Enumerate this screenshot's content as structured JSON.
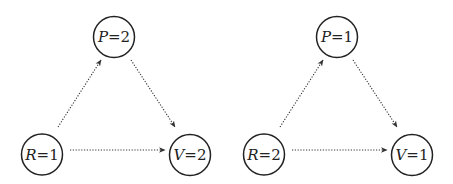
{
  "diagrams": [
    {
      "name": "left",
      "nodes": [
        {
          "id": "P",
          "variable": "P",
          "value": "2",
          "label": "P=2",
          "cx": 114,
          "cy": 37,
          "r": 20.5
        },
        {
          "id": "R",
          "variable": "R",
          "value": "1",
          "label": "R=1",
          "cx": 42,
          "cy": 154.5,
          "r": 20.5
        },
        {
          "id": "V",
          "variable": "V",
          "value": "2",
          "label": "V=2",
          "cx": 190,
          "cy": 155,
          "r": 20.5
        }
      ],
      "edges": [
        {
          "from": "R",
          "to": "P",
          "style": "dotted",
          "x1": 58,
          "y1": 127,
          "x2": 101,
          "y2": 60
        },
        {
          "from": "P",
          "to": "V",
          "style": "dotted",
          "x1": 131,
          "y1": 60,
          "x2": 175,
          "y2": 127
        },
        {
          "from": "R",
          "to": "V",
          "style": "dotted",
          "x1": 70,
          "y1": 150,
          "x2": 165,
          "y2": 150
        }
      ]
    },
    {
      "name": "right",
      "nodes": [
        {
          "id": "P",
          "variable": "P",
          "value": "1",
          "label": "P=1",
          "cx": 337,
          "cy": 37,
          "r": 20.5
        },
        {
          "id": "R",
          "variable": "R",
          "value": "2",
          "label": "R=2",
          "cx": 264,
          "cy": 154.5,
          "r": 20.5
        },
        {
          "id": "V",
          "variable": "V",
          "value": "1",
          "label": "V=1",
          "cx": 412,
          "cy": 155,
          "r": 20.5
        }
      ],
      "edges": [
        {
          "from": "R",
          "to": "P",
          "style": "dotted",
          "x1": 280,
          "y1": 127,
          "x2": 323,
          "y2": 60
        },
        {
          "from": "P",
          "to": "V",
          "style": "dotted",
          "x1": 353,
          "y1": 60,
          "x2": 397,
          "y2": 127
        },
        {
          "from": "R",
          "to": "V",
          "style": "dotted",
          "x1": 292,
          "y1": 150,
          "x2": 387,
          "y2": 150
        }
      ]
    }
  ],
  "colors": {
    "stroke": "#222222",
    "edge": "#333333",
    "background": "#ffffff"
  }
}
